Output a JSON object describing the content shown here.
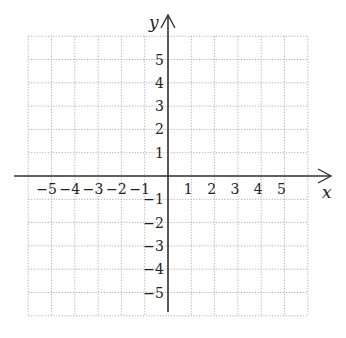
{
  "diagram": {
    "type": "coordinate-plane",
    "x_axis": {
      "label": "x",
      "min": -6,
      "max": 6,
      "tick_labels": [
        "−5",
        "−4",
        "−3",
        "−2",
        "−1",
        "1",
        "2",
        "3",
        "4",
        "5"
      ]
    },
    "y_axis": {
      "label": "y",
      "min": -6,
      "max": 6,
      "tick_labels_positive": [
        "5",
        "4",
        "3",
        "2",
        "1"
      ],
      "tick_labels_negative": [
        "−1",
        "−2",
        "−3",
        "−4",
        "−5"
      ]
    },
    "grid": {
      "style": "dotted",
      "step": 1,
      "color": "#b0b0b0"
    },
    "axis_color": "#333333"
  }
}
